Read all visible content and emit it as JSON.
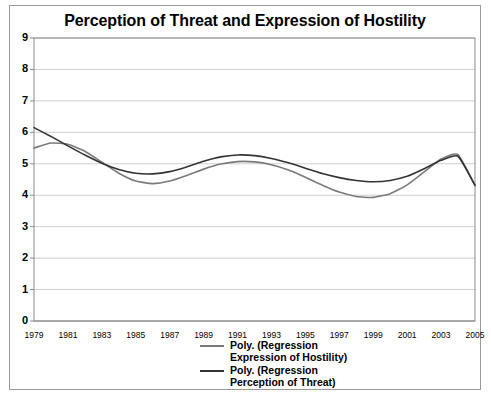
{
  "chart_data": {
    "type": "line",
    "title": "Perception of Threat and Expression of Hostility",
    "xlabel": "",
    "ylabel": "",
    "xlim": [
      1979,
      2005
    ],
    "ylim": [
      0,
      9
    ],
    "grid": true,
    "legend_position": "bottom-center",
    "x_tick_labels": [
      "1979",
      "1981",
      "1983",
      "1985",
      "1987",
      "1989",
      "1991",
      "1993",
      "1995",
      "1997",
      "1999",
      "2001",
      "2003",
      "2005"
    ],
    "y_tick_labels": [
      "0",
      "1",
      "2",
      "3",
      "4",
      "5",
      "6",
      "7",
      "8",
      "9"
    ],
    "x": [
      1979,
      1980,
      1981,
      1982,
      1983,
      1984,
      1985,
      1986,
      1987,
      1988,
      1989,
      1990,
      1991,
      1992,
      1993,
      1994,
      1995,
      1996,
      1997,
      1998,
      1999,
      2000,
      2001,
      2002,
      2003,
      2004,
      2005
    ],
    "series": [
      {
        "name": "Poly. (Regression Expression of Hostility)",
        "color": "#7a7a7a",
        "values": [
          5.5,
          5.66,
          5.62,
          5.4,
          5.05,
          4.7,
          4.45,
          4.37,
          4.45,
          4.63,
          4.83,
          4.99,
          5.07,
          5.06,
          4.97,
          4.8,
          4.57,
          4.32,
          4.1,
          3.96,
          3.93,
          4.05,
          4.33,
          4.74,
          5.15,
          5.29,
          4.3
        ]
      },
      {
        "name": "Poly. (Regression Perception of Threat)",
        "color": "#333333",
        "values": [
          6.15,
          5.87,
          5.57,
          5.28,
          5.02,
          4.82,
          4.7,
          4.68,
          4.75,
          4.9,
          5.08,
          5.22,
          5.28,
          5.26,
          5.17,
          5.03,
          4.86,
          4.69,
          4.56,
          4.47,
          4.43,
          4.47,
          4.6,
          4.84,
          5.11,
          5.24,
          4.32
        ]
      }
    ]
  },
  "legend": {
    "entries": [
      {
        "label": "Poly. (Regression Expression of Hostility)",
        "color": "#7a7a7a"
      },
      {
        "label": "Poly. (Regression Perception of Threat)",
        "color": "#333333"
      }
    ]
  }
}
